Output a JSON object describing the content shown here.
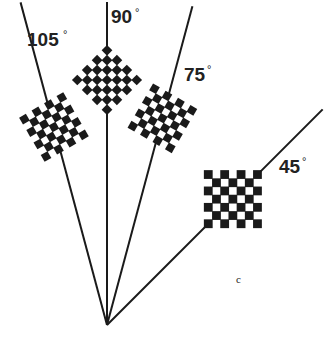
{
  "figure": {
    "panel_label": "c",
    "ink_color": "#1a1a1a",
    "background": "#ffffff",
    "checkerboard": {
      "rows": 7,
      "cols": 7,
      "corner_color": "black"
    },
    "stimuli": [
      {
        "id": "105",
        "angle_deg": 105,
        "label": "105",
        "degree_symbol": "°"
      },
      {
        "id": "90",
        "angle_deg": 90,
        "label": "90",
        "degree_symbol": "°"
      },
      {
        "id": "75",
        "angle_deg": 75,
        "label": "75",
        "degree_symbol": "°"
      },
      {
        "id": "45",
        "angle_deg": 45,
        "label": "45",
        "degree_symbol": "°"
      }
    ]
  }
}
